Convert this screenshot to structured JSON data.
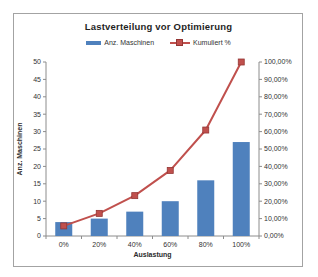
{
  "chart_data": {
    "type": "bar",
    "subtype": "combo-bar-line",
    "title": "Lastverteilung vor Optimierung",
    "xlabel": "Auslastung",
    "ylabel_left": "Anz. Maschinen",
    "categories": [
      "0%",
      "20%",
      "40%",
      "60%",
      "80%",
      "100%"
    ],
    "series": [
      {
        "name": "Anz. Maschinen",
        "chart_type": "bar",
        "axis": "left",
        "color": "#4F81BD",
        "values": [
          4,
          5,
          7,
          10,
          16,
          27
        ]
      },
      {
        "name": "Kumuliert %",
        "chart_type": "line",
        "axis": "right",
        "color": "#C0504D",
        "marker": "square",
        "marker_edge_color": "#943634",
        "values": [
          5.8,
          13.0,
          23.2,
          37.7,
          60.9,
          100.0
        ]
      }
    ],
    "left_axis": {
      "range": [
        0,
        50
      ],
      "step": 5,
      "tick_labels": [
        "0",
        "5",
        "10",
        "15",
        "20",
        "25",
        "30",
        "35",
        "40",
        "45",
        "50"
      ]
    },
    "right_axis": {
      "range": [
        0,
        100
      ],
      "step": 10,
      "tick_labels": [
        "0,00%",
        "10,00%",
        "20,00%",
        "30,00%",
        "40,00%",
        "50,00%",
        "60,00%",
        "70,00%",
        "80,00%",
        "90,00%",
        "100,00%"
      ]
    },
    "grid": false,
    "legend_position": "top",
    "axis_color": "#8c8c8c",
    "tick_text_color": "#333333",
    "frame_border_color": "#a3a3a3"
  }
}
